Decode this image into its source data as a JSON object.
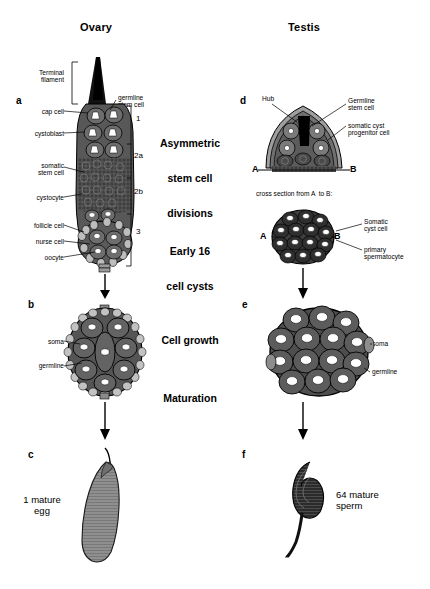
{
  "columns": {
    "left_title": "Ovary",
    "right_title": "Testis"
  },
  "center_stages": [
    {
      "id": "asymmetric",
      "line1": "Asymmetric",
      "line2": "stem cell",
      "line3": "divisions"
    },
    {
      "id": "early16",
      "line1": "Early 16",
      "line2": "cell cysts"
    },
    {
      "id": "cellgrowth",
      "line1": "Cell growth"
    },
    {
      "id": "maturation",
      "line1": "Maturation"
    }
  ],
  "panels": {
    "a": {
      "letter": "a"
    },
    "b": {
      "letter": "b"
    },
    "c": {
      "letter": "c"
    },
    "d": {
      "letter": "d"
    },
    "e": {
      "letter": "e"
    },
    "f": {
      "letter": "f"
    }
  },
  "ovary": {
    "terminal_filament": "Terminal\nfilament",
    "germline_stem_cell": "germline\nstem cell",
    "cap_cell": "cap cell",
    "cystoblast": "cystoblast",
    "somatic_stem_cell": "somatic\nstem cell",
    "cystocyte": "cystocyte",
    "follicle_cell": "follicle cell",
    "nurse_cell": "nurse cell",
    "oocyte": "oocyte",
    "regions": [
      "1",
      "2a",
      "2b",
      "3"
    ],
    "follicle_soma": "soma",
    "follicle_germline": "germline",
    "egg_label": "1 mature\negg"
  },
  "testis": {
    "hub": "Hub",
    "germline_stem_cell": "Germline\nstem cell",
    "somatic_cyst_progenitor": "somatic cyst\nprogenitor cell",
    "point_a": "A",
    "point_b": "B",
    "cross_section_note": "cross section from A  to B:",
    "somatic_cyst_cell": "Somatic\ncyst cell",
    "primary_spermatocyte": "primary\nspermatocyte",
    "cyst_soma": "soma",
    "cyst_germline": "germline",
    "sperm_label": "64 mature\nsperm"
  },
  "colors": {
    "ink": "#000000",
    "tissue_dark": "#4a4a4a",
    "tissue_mid": "#6b6b6b",
    "egg_gray": "#8a8a8a",
    "cell_white": "#ffffff",
    "background": "#ffffff"
  }
}
